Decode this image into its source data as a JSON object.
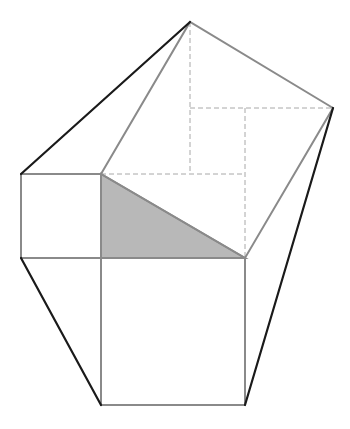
{
  "diagram": {
    "colors": {
      "background": "#ffffff",
      "gray_line": "#8a8a8a",
      "dark_line": "#1a1a1a",
      "dashed_line": "#a8a8a8",
      "triangle_fill": "#b8b8b8"
    },
    "points": {
      "apex": [
        190,
        22
      ],
      "right_vertex": [
        333,
        108
      ],
      "A_left_top": [
        21,
        174
      ],
      "B_right_angle": [
        101,
        174
      ],
      "C_acute": [
        245,
        258
      ],
      "D_left_bottom": [
        21,
        258
      ],
      "E_leg_bottom": [
        101,
        258
      ],
      "F_square_bl": [
        101,
        405
      ],
      "G_square_br": [
        245,
        405
      ],
      "dash_corner_1": [
        190,
        174
      ],
      "dash_corner_2": [
        190,
        108
      ],
      "dash_corner_3": [
        245,
        108
      ]
    },
    "shaded_triangle": [
      [
        101,
        174
      ],
      [
        101,
        258
      ],
      [
        245,
        258
      ]
    ],
    "small_square": [
      [
        21,
        174
      ],
      [
        101,
        174
      ],
      [
        101,
        258
      ],
      [
        21,
        258
      ]
    ],
    "large_square": [
      [
        101,
        258
      ],
      [
        245,
        258
      ],
      [
        245,
        405
      ],
      [
        101,
        405
      ]
    ],
    "hypotenuse_square": [
      [
        101,
        174
      ],
      [
        190,
        22
      ],
      [
        333,
        108
      ],
      [
        245,
        258
      ]
    ],
    "dark_lines": [
      [
        [
          21,
          174
        ],
        [
          190,
          22
        ]
      ],
      [
        [
          21,
          258
        ],
        [
          101,
          405
        ]
      ],
      [
        [
          245,
          405
        ],
        [
          333,
          108
        ]
      ]
    ],
    "dashed_lines": [
      [
        [
          190,
          22
        ],
        [
          190,
          174
        ]
      ],
      [
        [
          101,
          174
        ],
        [
          245,
          174
        ]
      ],
      [
        [
          190,
          108
        ],
        [
          333,
          108
        ]
      ],
      [
        [
          245,
          108
        ],
        [
          245,
          258
        ]
      ]
    ]
  }
}
